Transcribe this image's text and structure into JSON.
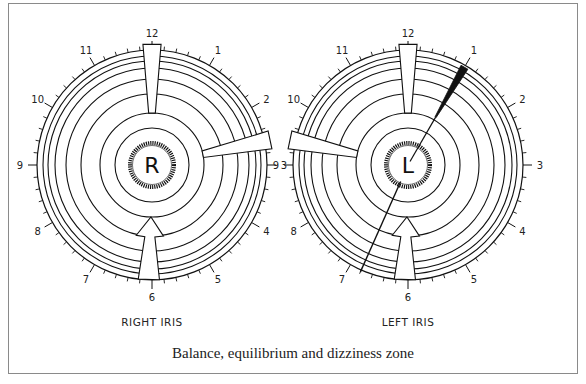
{
  "caption": "Balance, equilibrium and dizziness zone",
  "clock_labels": [
    "12",
    "1",
    "2",
    "3",
    "4",
    "5",
    "6",
    "7",
    "8",
    "9",
    "10",
    "11"
  ],
  "irises": [
    {
      "id": "right",
      "label": "RIGHT IRIS",
      "center_letter": "R",
      "markers": [
        {
          "type": "wedge-in",
          "clock_position": 12.0
        },
        {
          "type": "wedge-in",
          "clock_position": 2.6
        },
        {
          "type": "arrow-in",
          "clock_position": 6.0
        }
      ]
    },
    {
      "id": "left",
      "label": "LEFT IRIS",
      "center_letter": "L",
      "markers": [
        {
          "type": "wedge-in",
          "clock_position": 12.0
        },
        {
          "type": "wedge-in",
          "clock_position": 9.4
        },
        {
          "type": "arrow-in",
          "clock_position": 6.0
        },
        {
          "type": "black-bar",
          "clock_position": 1.0
        },
        {
          "type": "radial-line",
          "clock_position": 6.8
        }
      ]
    }
  ],
  "colors": {
    "ink": "#111111",
    "frame": "#8a8a8a",
    "background": "#ffffff"
  }
}
